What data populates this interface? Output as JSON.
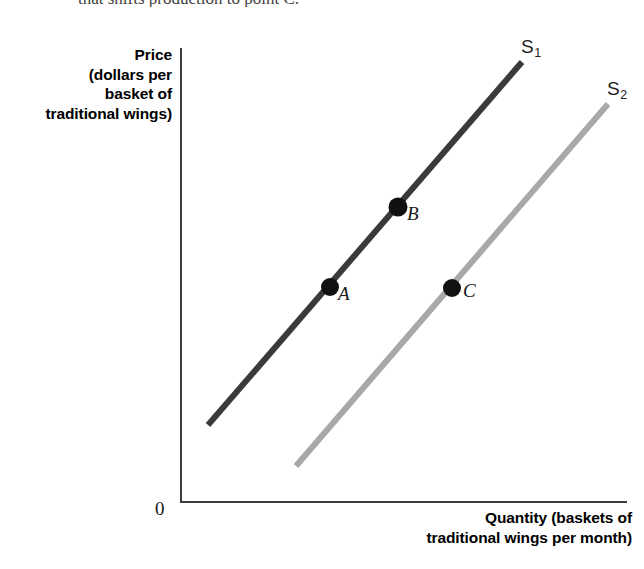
{
  "figure": {
    "top_text_fragment": "that shifts production to point C.",
    "origin_label": "0",
    "y_axis_label_lines": [
      "Price",
      "(dollars per",
      "basket of",
      "traditional wings)"
    ],
    "x_axis_label_lines": [
      "Quantity (baskets of",
      "traditional wings per month)"
    ]
  },
  "colors": {
    "supply_curve_1": "#3a3a3a",
    "supply_curve_2": "#a8a8a8",
    "axis": "#3c3c3c",
    "point_marker": "#111111",
    "background": "#ffffff"
  },
  "chart_data": {
    "type": "line",
    "title": "",
    "xlabel": "Quantity (baskets of traditional wings per month)",
    "ylabel": "Price (dollars per basket of traditional wings)",
    "grid": false,
    "legend": "inline-curve-labels",
    "axis_origin_label": "0",
    "xlim": [
      0,
      100
    ],
    "ylim": [
      0,
      100
    ],
    "series": [
      {
        "name": "S1",
        "label": "S",
        "subscript": "1",
        "color": "#3a3a3a",
        "style": "straight upward-sloping supply curve",
        "endpoints_px": [
          [
            208,
            425
          ],
          [
            522,
            62
          ]
        ],
        "label_position_px": [
          521,
          45
        ]
      },
      {
        "name": "S2",
        "label": "S",
        "subscript": "2",
        "color": "#a8a8a8",
        "style": "straight upward-sloping supply curve, shifted right of S1",
        "endpoints_px": [
          [
            296,
            466
          ],
          [
            608,
            104
          ]
        ],
        "label_position_px": [
          607,
          87
        ]
      }
    ],
    "points": [
      {
        "label": "A",
        "on_curve": "S1",
        "px": [
          330,
          287
        ],
        "label_px": [
          338,
          283
        ]
      },
      {
        "label": "B",
        "on_curve": "S1",
        "px": [
          398,
          207
        ],
        "label_px": [
          407,
          203
        ]
      },
      {
        "label": "C",
        "on_curve": "S2",
        "px": [
          452,
          288
        ],
        "label_px": [
          463,
          280
        ]
      }
    ],
    "annotations": [
      "Supply curve shifts rightward from S1 to S2",
      "Point A and point C occur at the same price level",
      "Point B lies above point A on curve S1"
    ]
  }
}
